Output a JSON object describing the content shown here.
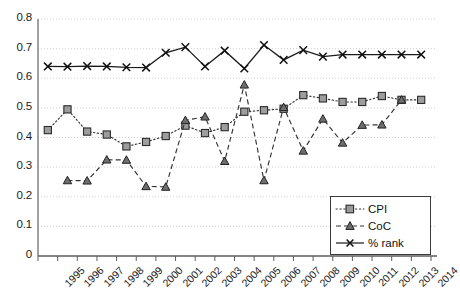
{
  "chart_data": {
    "type": "line",
    "title": "",
    "subtitle": "",
    "xlabel": "",
    "ylabel": "",
    "grid": true,
    "legend_position": "bottom-right",
    "ylim": [
      0,
      0.8
    ],
    "ytick_labels": [
      "0.8",
      "0.7",
      "0.6",
      "0.5",
      "0.4",
      "0.3",
      "0.2",
      "0.1",
      "0"
    ],
    "ytick_values": [
      0.8,
      0.7,
      0.6,
      0.5,
      0.4,
      0.3,
      0.2,
      0.1,
      0
    ],
    "categories": [
      "1995",
      "1996",
      "1997",
      "1998",
      "1999",
      "2000",
      "2001",
      "2002",
      "2003",
      "2004",
      "2005",
      "2006",
      "2007",
      "2008",
      "2009",
      "2010",
      "2011",
      "2012",
      "2013",
      "2014"
    ],
    "series": [
      {
        "name": "CPI",
        "marker": "square",
        "line_style": "dotted",
        "color": "#333333",
        "values": [
          0.425,
          0.495,
          0.42,
          0.41,
          0.37,
          0.385,
          0.405,
          0.44,
          0.415,
          0.435,
          0.487,
          0.492,
          0.497,
          0.543,
          0.532,
          0.52,
          0.52,
          0.54,
          0.527,
          0.527
        ]
      },
      {
        "name": "CoC",
        "marker": "triangle",
        "line_style": "dashed",
        "color": "#333333",
        "values": [
          null,
          0.255,
          0.254,
          0.325,
          0.324,
          0.235,
          0.233,
          0.458,
          0.47,
          0.32,
          0.578,
          0.255,
          0.502,
          0.355,
          0.463,
          0.382,
          0.442,
          0.443,
          0.527,
          null
        ]
      },
      {
        "name": "% rank",
        "marker": "cross",
        "line_style": "solid",
        "color": "#1a1a1a",
        "values": [
          0.64,
          0.639,
          0.641,
          0.64,
          0.637,
          0.636,
          0.686,
          0.705,
          0.64,
          0.693,
          0.633,
          0.712,
          0.662,
          0.695,
          0.673,
          0.68,
          0.68,
          0.68,
          0.68,
          0.68
        ]
      }
    ]
  },
  "legend": {
    "items": [
      {
        "label": "CPI"
      },
      {
        "label": "CoC"
      },
      {
        "label": "% rank"
      }
    ]
  }
}
